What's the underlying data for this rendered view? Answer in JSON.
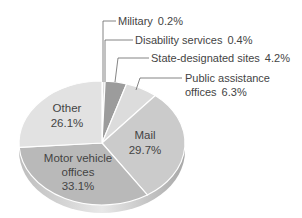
{
  "chart_data": {
    "type": "pie",
    "title": "",
    "style": "3d-exploded-tilt",
    "categories": [
      "Military",
      "Disability services",
      "State-designated sites",
      "Public assistance offices",
      "Mail",
      "Motor vehicle offices",
      "Other"
    ],
    "values": [
      0.2,
      0.4,
      4.2,
      6.3,
      29.7,
      33.1,
      26.1
    ],
    "unit": "%",
    "colors": [
      "#cfcfcf",
      "#bdbdbd",
      "#9c9c9c",
      "#dcdcdc",
      "#cbcbcb",
      "#b9b9b9",
      "#e2e2e2"
    ],
    "labels": {
      "military": "Military",
      "military_value": "0.2%",
      "disability": "Disability services",
      "disability_value": "0.4%",
      "state": "State-designated sites",
      "state_value": "4.2%",
      "public_line1": "Public assistance",
      "public_line2": "offices",
      "public_value": "6.3%",
      "mail": "Mail",
      "mail_value": "29.7%",
      "motor_line1": "Motor vehicle",
      "motor_line2": "offices",
      "motor_value": "33.1%",
      "other": "Other",
      "other_value": "26.1%"
    }
  }
}
